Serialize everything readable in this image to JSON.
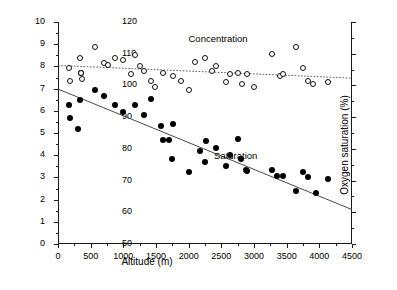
{
  "chart_data": {
    "type": "scatter",
    "title": "",
    "xlabel": "Altitude (m)",
    "ylabel": "Oxygen concentration (mg L-1)",
    "ylabel_right": "Oxygen saturation (%)",
    "xlim": [
      0,
      4500
    ],
    "ylim_left": [
      0,
      10
    ],
    "ylim_right": [
      50,
      120
    ],
    "grid": false,
    "legend_position": "inline-annotations",
    "x_ticks": [
      0,
      500,
      1000,
      1500,
      2000,
      2500,
      3000,
      3500,
      4000,
      4500
    ],
    "x_tick_labels": [
      "0",
      "500",
      "1000",
      "1500",
      "2000",
      "2500",
      "3000",
      "3500",
      "4000",
      "4500"
    ],
    "x_minor_step": 250,
    "y_ticks_left": [
      0,
      1,
      2,
      3,
      4,
      5,
      6,
      7,
      8,
      9,
      10
    ],
    "y_tick_labels_left": [
      "0",
      "1",
      "2",
      "3",
      "4",
      "5",
      "6",
      "7",
      "8",
      "9",
      "10"
    ],
    "y_minor_step_left": 0.5,
    "y_ticks_right": [
      50,
      60,
      70,
      80,
      90,
      100,
      110,
      120
    ],
    "y_tick_labels_right": [
      "50",
      "60",
      "70",
      "80",
      "90",
      "100",
      "110",
      "120"
    ],
    "y_minor_step_right": 5,
    "annotations": [
      {
        "text": "Concentration",
        "x": 2450,
        "y_right": 114.5,
        "axis": "right"
      },
      {
        "text": "Saturation",
        "x": 2720,
        "y_left": 3.95,
        "axis": "left"
      }
    ],
    "series": [
      {
        "name": "Saturation",
        "marker": "filled-circle",
        "axis": "left",
        "color": "#000000",
        "points": [
          [
            170,
            6.27
          ],
          [
            180,
            5.68
          ],
          [
            300,
            5.18
          ],
          [
            330,
            6.5
          ],
          [
            350,
            7.7
          ],
          [
            560,
            6.95
          ],
          [
            700,
            6.67
          ],
          [
            880,
            6.25
          ],
          [
            1000,
            5.95
          ],
          [
            1180,
            6.27
          ],
          [
            1320,
            5.82
          ],
          [
            1430,
            6.55
          ],
          [
            1580,
            5.32
          ],
          [
            1600,
            4.67
          ],
          [
            1700,
            4.7
          ],
          [
            1740,
            3.85
          ],
          [
            1760,
            5.42
          ],
          [
            2000,
            3.25
          ],
          [
            2180,
            4.18
          ],
          [
            2250,
            3.7
          ],
          [
            2270,
            4.62
          ],
          [
            2420,
            4.33
          ],
          [
            2570,
            3.52
          ],
          [
            2640,
            4.03
          ],
          [
            2760,
            4.72
          ],
          [
            2800,
            3.82
          ],
          [
            2880,
            3.35
          ],
          [
            2900,
            3.28
          ],
          [
            3270,
            3.35
          ],
          [
            3350,
            3.05
          ],
          [
            3450,
            3.08
          ],
          [
            3650,
            2.4
          ],
          [
            3750,
            3.25
          ],
          [
            3830,
            3.0
          ],
          [
            3950,
            2.3
          ],
          [
            4140,
            2.92
          ]
        ]
      },
      {
        "name": "Concentration",
        "marker": "open-circle",
        "axis": "right",
        "color": "#111111",
        "points_saturation": [
          [
            170,
            105.5
          ],
          [
            180,
            101.5
          ],
          [
            330,
            108.5
          ],
          [
            350,
            104.0
          ],
          [
            360,
            102.0
          ],
          [
            560,
            112.0
          ],
          [
            700,
            107.0
          ],
          [
            760,
            106.5
          ],
          [
            880,
            108.5
          ],
          [
            1000,
            108.0
          ],
          [
            1120,
            103.5
          ],
          [
            1180,
            109.5
          ],
          [
            1250,
            106.0
          ],
          [
            1320,
            104.5
          ],
          [
            1430,
            101.5
          ],
          [
            1480,
            99.5
          ],
          [
            1600,
            104.0
          ],
          [
            1760,
            103.0
          ],
          [
            1880,
            101.5
          ],
          [
            2000,
            98.5
          ],
          [
            2100,
            107.5
          ],
          [
            2250,
            108.5
          ],
          [
            2350,
            104.5
          ],
          [
            2420,
            106.0
          ],
          [
            2570,
            101.0
          ],
          [
            2640,
            103.5
          ],
          [
            2760,
            104.0
          ],
          [
            2820,
            100.5
          ],
          [
            2900,
            103.5
          ],
          [
            3000,
            99.5
          ],
          [
            3270,
            110.0
          ],
          [
            3400,
            103.0
          ],
          [
            3450,
            103.5
          ],
          [
            3650,
            112.0
          ],
          [
            3750,
            105.5
          ],
          [
            3830,
            101.5
          ],
          [
            3900,
            100.5
          ],
          [
            4140,
            101.0
          ]
        ]
      }
    ],
    "fit_lines": [
      {
        "name": "saturation-fit",
        "style": "solid",
        "axis": "left",
        "x0": 0,
        "y0": 6.98,
        "x1": 4500,
        "y1": 1.55
      },
      {
        "name": "concentration-fit",
        "style": "dotted",
        "axis": "right",
        "x0": 0,
        "y0": 106.3,
        "x1": 4500,
        "y1": 102.3
      }
    ]
  }
}
